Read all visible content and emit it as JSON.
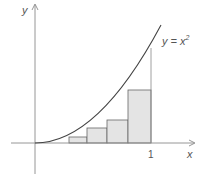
{
  "diagram": {
    "curve_label": "y = x",
    "curve_label_exp": "2",
    "x_axis_label": "x",
    "y_axis_label": "y",
    "x_tick_label": "1",
    "colors": {
      "axis": "#8a8a8a",
      "curve": "#444444",
      "rect_fill": "#e4e4e4",
      "rect_stroke": "#666666",
      "text": "#555555"
    },
    "rectangles": [
      {
        "x0": 0.29,
        "x1": 0.45,
        "height_frac": 0.07
      },
      {
        "x0": 0.45,
        "x1": 0.62,
        "height_frac": 0.16
      },
      {
        "x0": 0.62,
        "x1": 0.8,
        "height_frac": 0.24
      },
      {
        "x0": 0.8,
        "x1": 1.0,
        "height_frac": 0.56
      }
    ]
  }
}
